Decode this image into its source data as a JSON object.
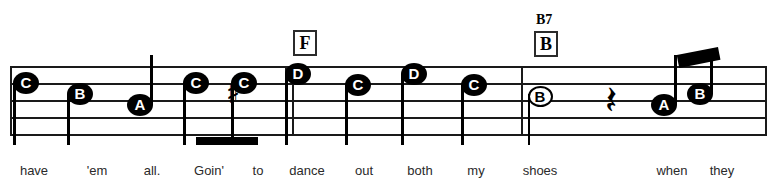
{
  "sheet": {
    "width": 777,
    "height": 189,
    "ink_color": "#1a1a1a",
    "lyric_color": "#2a2a2a"
  },
  "staff": {
    "line_count": 5,
    "left": 10,
    "right": 767,
    "line_ys": [
      66,
      83,
      100,
      117,
      134
    ],
    "line_spacing": 17
  },
  "barlines": [
    {
      "name": "barline-start",
      "x": 10,
      "top": 66,
      "height": 70
    },
    {
      "name": "barline-double-left",
      "x": 285,
      "top": 66,
      "height": 70
    },
    {
      "name": "barline-double-right",
      "x": 292,
      "top": 66,
      "height": 70
    },
    {
      "name": "barline-measure",
      "x": 521,
      "top": 66,
      "height": 70
    },
    {
      "name": "barline-end",
      "x": 765,
      "top": 66,
      "height": 70
    }
  ],
  "notes": [
    {
      "label": "C",
      "x": 26,
      "y": 83,
      "filled": true,
      "stem": "down"
    },
    {
      "label": "B",
      "x": 80,
      "y": 94,
      "filled": true,
      "stem": "down"
    },
    {
      "label": "A",
      "x": 140,
      "y": 105,
      "filled": true,
      "stem": "up"
    },
    {
      "label": "C",
      "x": 196,
      "y": 83,
      "filled": true,
      "stem": "down",
      "accidental": ""
    },
    {
      "label": "C",
      "x": 244,
      "y": 83,
      "filled": true,
      "stem": "down",
      "accidental": "sharp"
    },
    {
      "label": "D",
      "x": 298,
      "y": 74,
      "filled": true,
      "stem": "down"
    },
    {
      "label": "C",
      "x": 358,
      "y": 85,
      "filled": true,
      "stem": "down"
    },
    {
      "label": "D",
      "x": 414,
      "y": 74,
      "filled": true,
      "stem": "down"
    },
    {
      "label": "C",
      "x": 474,
      "y": 85,
      "filled": true,
      "stem": "down"
    },
    {
      "label": "B",
      "x": 538,
      "y": 94,
      "filled": false,
      "stem": "down"
    },
    {
      "label": "A",
      "x": 664,
      "y": 105,
      "filled": true,
      "stem": "up"
    },
    {
      "label": "B",
      "x": 700,
      "y": 94,
      "filled": true,
      "stem": "up"
    }
  ],
  "accidentals": [
    {
      "name": "sharp-accidental",
      "glyph": "♯",
      "x": 226,
      "y": 78
    }
  ],
  "rests": [
    {
      "name": "quarter-rest",
      "glyph": "𝄽",
      "x": 605,
      "y": 80,
      "fallback": "❧"
    }
  ],
  "chords": [
    {
      "name": "F",
      "box_label": "F",
      "chord_text": "",
      "box_x": 293,
      "box_y": 30
    },
    {
      "name": "B7",
      "box_label": "B",
      "chord_text": "B7",
      "box_x": 534,
      "box_y": 31
    }
  ],
  "lyrics": [
    {
      "text": "have",
      "x": 34
    },
    {
      "text": "'em",
      "x": 97
    },
    {
      "text": "all.",
      "x": 152
    },
    {
      "text": "Goin'",
      "x": 209
    },
    {
      "text": "to",
      "x": 258
    },
    {
      "text": "dance",
      "x": 307
    },
    {
      "text": "out",
      "x": 364
    },
    {
      "text": "both",
      "x": 420
    },
    {
      "text": "my",
      "x": 476
    },
    {
      "text": "shoes",
      "x": 540
    },
    {
      "text": "when",
      "x": 672
    },
    {
      "text": "they",
      "x": 722
    }
  ]
}
